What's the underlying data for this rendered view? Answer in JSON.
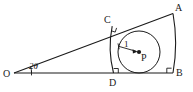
{
  "figure": {
    "background_color": "#ffffff",
    "stroke_color": "#1a1a1a",
    "labels": {
      "vertex_O": "O",
      "point_A": "A",
      "point_B": "B",
      "point_C": "C",
      "point_D": "D",
      "center_P": "P",
      "angle": "2θ",
      "radius": "1"
    },
    "icons": {
      "center_dot": "filled-dot",
      "right_angle_c": "right-angle-mark",
      "right_angle_d": "right-angle-mark",
      "angle_arc": "angle-arc-mark",
      "radius_arrow": "arrow-head"
    },
    "geometry": {
      "O": [
        14,
        73
      ],
      "A": [
        172,
        14
      ],
      "B": [
        172,
        73
      ],
      "C": [
        112,
        26
      ],
      "D": [
        113,
        73
      ],
      "P": [
        139,
        52
      ],
      "circle_radius": 21,
      "angle_degrees": 20.5,
      "angle_arc_radius": 17
    }
  }
}
